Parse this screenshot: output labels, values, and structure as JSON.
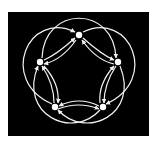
{
  "diagram": {
    "type": "directed-graph",
    "background": "#000000",
    "stroke": "#f2f2f2",
    "nodes": [
      {
        "id": "top",
        "x": 79,
        "y": 35
      },
      {
        "id": "right",
        "x": 118,
        "y": 62
      },
      {
        "id": "bottom-right",
        "x": 103,
        "y": 107
      },
      {
        "id": "bottom-left",
        "x": 55,
        "y": 107
      },
      {
        "id": "left",
        "x": 40,
        "y": 62
      }
    ],
    "inner_edges": [
      [
        "top",
        "right"
      ],
      [
        "right",
        "bottom-right"
      ],
      [
        "bottom-right",
        "bottom-left"
      ],
      [
        "bottom-left",
        "left"
      ],
      [
        "left",
        "top"
      ]
    ],
    "outer_edges": [
      [
        "left",
        "right"
      ],
      [
        "top",
        "bottom-right"
      ],
      [
        "right",
        "bottom-left"
      ],
      [
        "bottom-right",
        "left"
      ],
      [
        "bottom-left",
        "top"
      ]
    ]
  }
}
